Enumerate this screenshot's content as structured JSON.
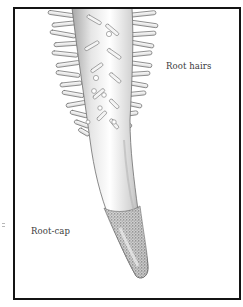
{
  "figure": {
    "labels": {
      "root_hairs": "Root hairs",
      "root_cap": "Root-cap"
    },
    "colors": {
      "frame": "#141414",
      "background": "#ffffff",
      "label_text": "#3a3a3a",
      "root_light": "#f2f2f2",
      "root_shade": "#9a9a9a",
      "root_cap_stipple": "#5a5a5a"
    }
  }
}
